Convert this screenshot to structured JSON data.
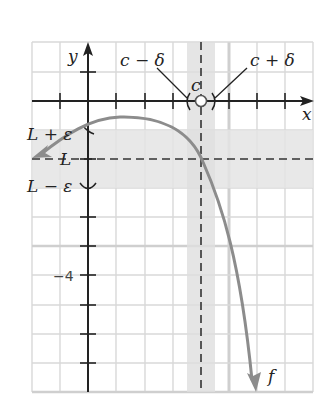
{
  "diagram": {
    "axes": {
      "x_label": "x",
      "y_label": "y"
    },
    "tick_labels": {
      "y_minus_4": "−4"
    },
    "point_labels": {
      "c": "c",
      "c_minus_delta": "c − δ",
      "c_plus_delta": "c + δ",
      "L": "L",
      "L_plus_epsilon": "L + ε",
      "L_minus_epsilon": "L − ε"
    },
    "function_label": "f",
    "colors": {
      "grid": "#d6d6d6",
      "band": "#e6e6e6",
      "band_overlap": "#d4d4d4",
      "axis": "#222222",
      "curve": "#8c8c8c",
      "dashed": "#333333"
    },
    "features": {
      "open_circle_at": "(c, 0)",
      "horizontal_band": "between L − ε and L + ε",
      "vertical_band": "between c − δ and c + δ",
      "dashed_lines": [
        "x = c",
        "y = L"
      ]
    }
  }
}
